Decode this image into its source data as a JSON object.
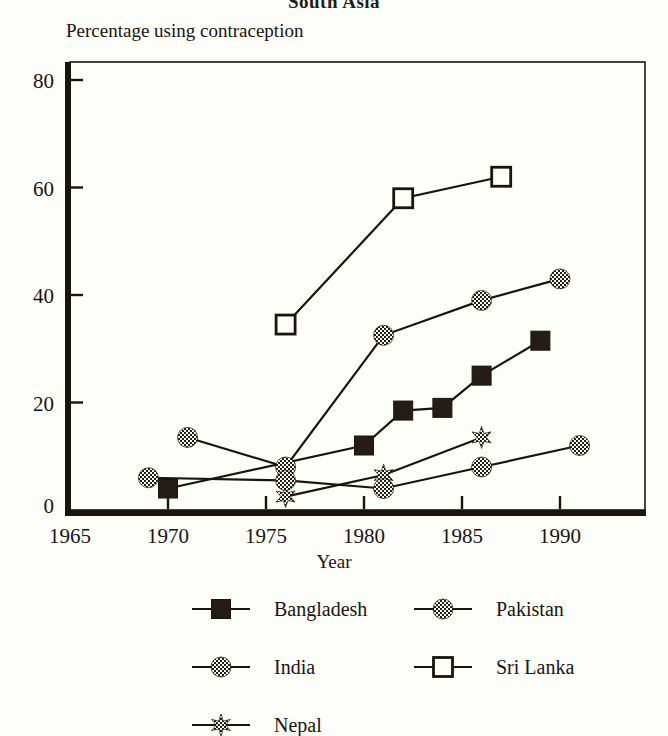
{
  "chart_data": {
    "type": "line",
    "title": "South Asia",
    "ylabel": "Percentage using contraception",
    "xlabel": "Year",
    "xlim": [
      1965,
      1992
    ],
    "ylim": [
      0,
      85
    ],
    "xticks": [
      1965,
      1970,
      1975,
      1980,
      1985,
      1990
    ],
    "xtick_labels": [
      "1965",
      "1970",
      "1975",
      "1980",
      "1985",
      "1990"
    ],
    "yticks": [
      0,
      20,
      40,
      60,
      80
    ],
    "ytick_labels": [
      "0",
      "20",
      "40",
      "60",
      "80"
    ],
    "grid": false,
    "legend_position": "bottom",
    "series": [
      {
        "name": "Bangladesh",
        "marker": "filled-square",
        "x": [
          1970,
          1980,
          1982,
          1984,
          1986,
          1989
        ],
        "y": [
          4,
          12,
          18.5,
          19,
          25,
          31.5
        ]
      },
      {
        "name": "India",
        "marker": "checkered-circle",
        "x": [
          1971,
          1976,
          1981,
          1986,
          1990
        ],
        "y": [
          13.5,
          8,
          32.5,
          39,
          43
        ]
      },
      {
        "name": "Nepal",
        "marker": "checkered-star",
        "x": [
          1976,
          1981,
          1986
        ],
        "y": [
          2.5,
          6.5,
          13.5
        ]
      },
      {
        "name": "Pakistan",
        "marker": "checkered-circle",
        "x": [
          1969,
          1976,
          1981,
          1986,
          1991
        ],
        "y": [
          6,
          5.5,
          4,
          8,
          12
        ]
      },
      {
        "name": "Sri Lanka",
        "marker": "open-square",
        "x": [
          1976,
          1982,
          1987
        ],
        "y": [
          34.5,
          58,
          62
        ]
      }
    ]
  },
  "legend": {
    "entries": [
      {
        "label": "Bangladesh",
        "marker": "filled-square"
      },
      {
        "label": "Pakistan",
        "marker": "checkered-circle"
      },
      {
        "label": "India",
        "marker": "checkered-circle"
      },
      {
        "label": "Sri Lanka",
        "marker": "open-square"
      },
      {
        "label": "Nepal",
        "marker": "checkered-star"
      }
    ]
  },
  "colors": {
    "ink": "#1a1410",
    "paper": "#fdfdfa",
    "marker_fill": "#241c16"
  }
}
